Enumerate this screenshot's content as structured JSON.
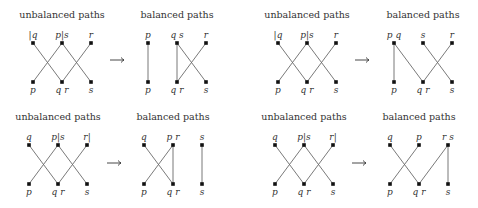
{
  "rows": [
    {
      "pairs": [
        {
          "unbalanced": {
            "title": "unbalanced paths",
            "top_labels": [
              "|q",
              "p|s",
              "r"
            ],
            "bottom_labels": [
              "p",
              "q r",
              "s"
            ],
            "edges": [
              [
                0,
                1
              ],
              [
                1,
                0
              ],
              [
                1,
                2
              ],
              [
                2,
                1
              ]
            ]
          },
          "balanced": {
            "title": "balanced paths",
            "top_labels": [
              "p",
              "q s",
              "r"
            ],
            "bottom_labels": [
              "p",
              "q r",
              "s"
            ],
            "edges": [
              [
                0,
                0
              ],
              [
                1,
                1
              ],
              [
                1,
                2
              ],
              [
                2,
                1
              ]
            ]
          }
        },
        {
          "unbalanced": {
            "title": "unbalanced paths",
            "top_labels": [
              "|q",
              "p|s",
              "r"
            ],
            "bottom_labels": [
              "p",
              "q r",
              "s"
            ],
            "edges": [
              [
                0,
                1
              ],
              [
                1,
                0
              ],
              [
                1,
                2
              ],
              [
                2,
                1
              ]
            ]
          },
          "balanced": {
            "title": "balanced paths",
            "top_labels": [
              "p q",
              "s",
              "r"
            ],
            "bottom_labels": [
              "p",
              "q r",
              "s"
            ],
            "edges": [
              [
                0,
                0
              ],
              [
                0,
                1
              ],
              [
                1,
                2
              ],
              [
                2,
                1
              ]
            ]
          }
        }
      ]
    },
    {
      "pairs": [
        {
          "unbalanced": {
            "title": "unbalanced paths",
            "top_labels": [
              "q",
              "p|s",
              "r|"
            ],
            "bottom_labels": [
              "p",
              "q r",
              "s"
            ],
            "edges": [
              [
                0,
                1
              ],
              [
                1,
                0
              ],
              [
                1,
                2
              ],
              [
                2,
                1
              ]
            ]
          },
          "balanced": {
            "title": "balanced paths",
            "top_labels": [
              "q",
              "p r",
              "s"
            ],
            "bottom_labels": [
              "p",
              "q r",
              "s"
            ],
            "edges": [
              [
                0,
                1
              ],
              [
                1,
                0
              ],
              [
                1,
                1
              ],
              [
                2,
                2
              ]
            ]
          }
        },
        {
          "unbalanced": {
            "title": "unbalanced paths",
            "top_labels": [
              "q",
              "p|s",
              "r|"
            ],
            "bottom_labels": [
              "p",
              "q r",
              "s"
            ],
            "edges": [
              [
                0,
                1
              ],
              [
                1,
                0
              ],
              [
                1,
                2
              ],
              [
                2,
                1
              ]
            ]
          },
          "balanced": {
            "title": "balanced paths",
            "top_labels": [
              "q",
              "p",
              "r s"
            ],
            "bottom_labels": [
              "p",
              "q r",
              "s"
            ],
            "edges": [
              [
                0,
                1
              ],
              [
                1,
                0
              ],
              [
                2,
                1
              ],
              [
                2,
                2
              ]
            ]
          }
        }
      ]
    }
  ],
  "arrow_symbol": "→"
}
